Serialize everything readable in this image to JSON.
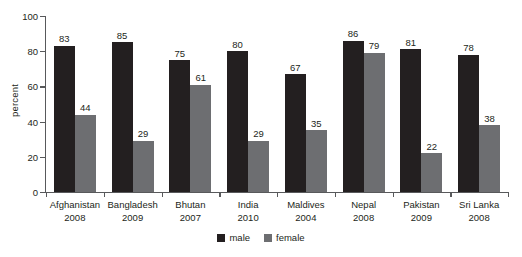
{
  "chart_data": {
    "type": "bar",
    "title": "",
    "xlabel": "",
    "ylabel": "percent",
    "ylim": [
      0,
      100
    ],
    "yticks": [
      0,
      20,
      40,
      60,
      80,
      100
    ],
    "grid": false,
    "legend_position": "bottom-center",
    "categories": [
      "Afghanistan",
      "Bangladesh",
      "Bhutan",
      "India",
      "Maldives",
      "Nepal",
      "Pakistan",
      "Sri Lanka"
    ],
    "category_years": [
      "2008",
      "2009",
      "2007",
      "2010",
      "2004",
      "2008",
      "2009",
      "2008"
    ],
    "series": [
      {
        "name": "male",
        "color": "#231f20",
        "values": [
          83,
          85,
          75,
          80,
          67,
          86,
          81,
          78
        ]
      },
      {
        "name": "female",
        "color": "#6d6e71",
        "values": [
          44,
          29,
          61,
          29,
          35,
          79,
          22,
          38
        ]
      }
    ]
  },
  "axis": {
    "color": "#58595b"
  }
}
